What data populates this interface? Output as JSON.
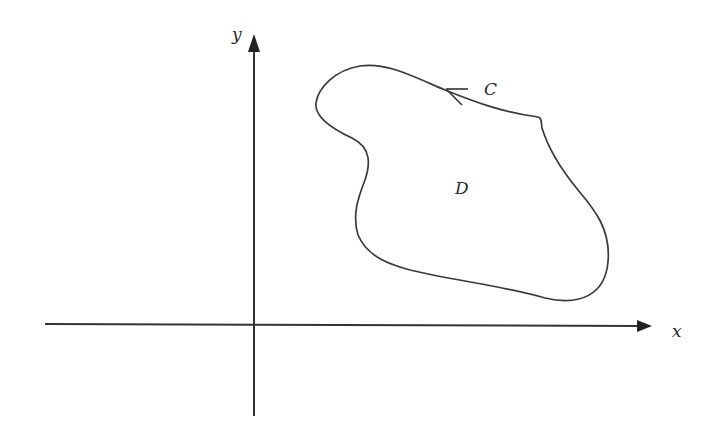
{
  "diagram": {
    "type": "region-with-boundary-curve",
    "axes": {
      "x_label": "x",
      "y_label": "y"
    },
    "region": {
      "label": "D"
    },
    "curve": {
      "label": "C",
      "orientation": "counterclockwise",
      "arrow_icon": "arrowhead-left-icon"
    },
    "colors": {
      "line": "#333333",
      "background": "#ffffff"
    }
  }
}
